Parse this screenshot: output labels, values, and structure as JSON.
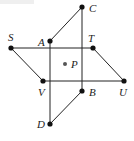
{
  "diagram": {
    "colors": {
      "line": "#222222",
      "point": "#111111",
      "center_point": "#555555"
    },
    "points": {
      "C": {
        "label": "C",
        "x": 82,
        "y": 7
      },
      "A": {
        "label": "A",
        "x": 50,
        "y": 41
      },
      "S": {
        "label": "S",
        "x": 11,
        "y": 48
      },
      "T": {
        "label": "T",
        "x": 93,
        "y": 48
      },
      "P": {
        "label": "P",
        "x": 65,
        "y": 64
      },
      "V": {
        "label": "V",
        "x": 43,
        "y": 81
      },
      "U": {
        "label": "U",
        "x": 124,
        "y": 81
      },
      "B": {
        "label": "B",
        "x": 82,
        "y": 91
      },
      "D": {
        "label": "D",
        "x": 50,
        "y": 124
      }
    },
    "shapes": [
      {
        "name": "parallelogram-STUV",
        "vertices": [
          "S",
          "T",
          "U",
          "V"
        ]
      },
      {
        "name": "parallelogram-ACBD",
        "vertices": [
          "A",
          "C",
          "B",
          "D"
        ]
      }
    ]
  }
}
